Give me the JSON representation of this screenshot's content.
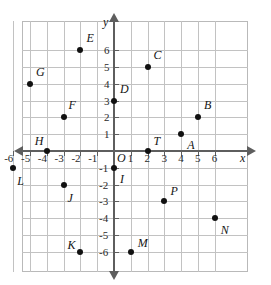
{
  "chart_data": {
    "type": "scatter",
    "title": "",
    "xlabel": "x",
    "ylabel": "y",
    "xlim": [
      -7,
      7
    ],
    "ylim": [
      -7,
      7
    ],
    "grid": true,
    "legend": "none",
    "origin_label": "O",
    "xticks": [
      -6,
      -5,
      -4,
      -3,
      -2,
      -1,
      1,
      2,
      3,
      4,
      5,
      6
    ],
    "yticks": [
      6,
      5,
      4,
      3,
      2,
      1,
      -1,
      -2,
      -3,
      -4,
      -5,
      -6
    ],
    "xticklabels": [
      "-6",
      "-5",
      "-4",
      "-3",
      "-2",
      "-1",
      "1",
      "2",
      "3",
      "4",
      "5",
      "6"
    ],
    "yticklabels": [
      "6",
      "5",
      "4",
      "3",
      "2",
      "1",
      "-1",
      "-2",
      "-3",
      "-4",
      "-5",
      "-6"
    ],
    "points": [
      {
        "label": "A",
        "x": 4,
        "y": 1,
        "lx": 6,
        "ly": 11
      },
      {
        "label": "B",
        "x": 5,
        "y": 2,
        "lx": 6,
        "ly": -12
      },
      {
        "label": "C",
        "x": 2,
        "y": 5,
        "lx": 6,
        "ly": -12
      },
      {
        "label": "D",
        "x": 0,
        "y": 3,
        "lx": 6,
        "ly": -12
      },
      {
        "label": "E",
        "x": -2,
        "y": 6,
        "lx": 6,
        "ly": -12
      },
      {
        "label": "F",
        "x": -3,
        "y": 2,
        "lx": 5,
        "ly": -12
      },
      {
        "label": "G",
        "x": -5,
        "y": 4,
        "lx": 6,
        "ly": -12
      },
      {
        "label": "H",
        "x": -4,
        "y": 0,
        "lx": -12,
        "ly": -10
      },
      {
        "label": "I",
        "x": 0,
        "y": -1,
        "lx": 6,
        "ly": 11
      },
      {
        "label": "J",
        "x": -3,
        "y": -2,
        "lx": 4,
        "ly": 13
      },
      {
        "label": "K",
        "x": -2,
        "y": -6,
        "lx": -13,
        "ly": -7
      },
      {
        "label": "L",
        "x": -6,
        "y": -1,
        "lx": 4,
        "ly": 13
      },
      {
        "label": "M",
        "x": 1,
        "y": -6,
        "lx": 7,
        "ly": -9
      },
      {
        "label": "N",
        "x": 6,
        "y": -4,
        "lx": 6,
        "ly": 12
      },
      {
        "label": "P",
        "x": 3,
        "y": -3,
        "lx": 6,
        "ly": -10
      },
      {
        "label": "T",
        "x": 2,
        "y": 0,
        "lx": 6,
        "ly": -10
      }
    ]
  }
}
